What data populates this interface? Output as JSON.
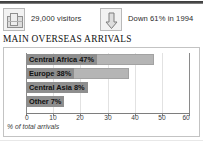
{
  "stats": [
    {
      "icon": "suitcase-icon",
      "text": "29,000 visitors"
    },
    {
      "icon": "down-arrow-icon",
      "text": "Down 61% in 1994"
    }
  ],
  "headline": "MAIN OVERSEAS ARRIVALS",
  "colors": {
    "bar_fill": "#b5b5b5",
    "bar_stroke": "#a2a2a2",
    "label_chip": "#8e8e8e",
    "grid": "#e2e2e2",
    "axis": "#7e7e7e",
    "panel_border": "#c3c3c3",
    "top_rule": "#3a3a3a"
  },
  "chart_data": {
    "type": "bar",
    "orientation": "horizontal",
    "title": "MAIN OVERSEAS ARRIVALS",
    "xlabel": "% of total arrivals",
    "ylabel": "",
    "xlim": [
      0,
      60
    ],
    "grid": true,
    "legend": "none",
    "ticks": [
      0,
      10,
      20,
      30,
      40,
      50,
      60
    ],
    "categories": [
      "Central Africa",
      "Europe",
      "Central Asia",
      "Other"
    ],
    "values": [
      47,
      38,
      8,
      7
    ],
    "labels": [
      "Central Africa 47%",
      "Europe 38%",
      "Central Asia 8%",
      "Other 7%"
    ]
  }
}
